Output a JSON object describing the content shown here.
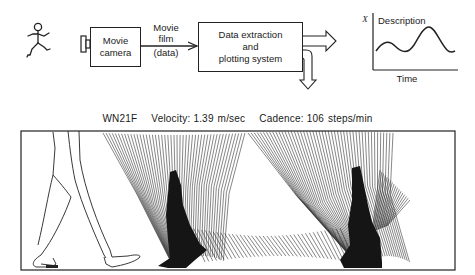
{
  "pipeline": {
    "subject_icon": "stick-figure-walking-icon",
    "camera": {
      "label_line1": "Movie",
      "label_line2": "camera",
      "icon": "camera-lens-icon"
    },
    "film_label": {
      "line1": "Movie",
      "line2": "film",
      "line3": "(data)"
    },
    "processor": {
      "line1": "Data extraction",
      "line2": "and",
      "line3": "plotting system"
    },
    "outputs": [
      "right-output-arrow",
      "down-output-arrow"
    ],
    "graph": {
      "y_axis_label": "X",
      "x_axis_label": "Time",
      "curve_label": "Description"
    }
  },
  "gait_plot": {
    "subject_id": "WN21F",
    "velocity_label": "Velocity:",
    "velocity_value": "1.39 m/sec",
    "cadence_label": "Cadence:",
    "cadence_value": "106 steps/min",
    "illustration": "stick-diagram-of-leg-segments-over-one-stride"
  },
  "colors": {
    "ink": "#1a1a1a",
    "background": "#ffffff"
  }
}
